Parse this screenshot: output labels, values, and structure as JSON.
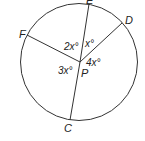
{
  "diagram": {
    "type": "circle-with-radii",
    "center_label": "P",
    "points": [
      {
        "name": "E",
        "x": 89,
        "y": 4,
        "label_x": 86,
        "label_y": 4
      },
      {
        "name": "D",
        "x": 122,
        "y": 23,
        "label_x": 125,
        "label_y": 24
      },
      {
        "name": "F",
        "x": 27,
        "y": 35,
        "label_x": 19,
        "label_y": 38
      },
      {
        "name": "C",
        "x": 70,
        "y": 119,
        "label_x": 64,
        "label_y": 132
      }
    ],
    "angles": [
      {
        "label": "2x°",
        "between": [
          "F",
          "E"
        ]
      },
      {
        "label": "x°",
        "between": [
          "E",
          "D"
        ]
      },
      {
        "label": "4x°",
        "between": [
          "D",
          "C"
        ]
      },
      {
        "label": "3x°",
        "between": [
          "C",
          "F"
        ]
      }
    ],
    "labels": {
      "E": "E",
      "D": "D",
      "F": "F",
      "C": "C",
      "P": "P",
      "angle_FPE": "2x°",
      "angle_EPD": "x°",
      "angle_DPC": "4x°",
      "angle_CPF": "3x°"
    },
    "stroke_color": "#333333"
  }
}
